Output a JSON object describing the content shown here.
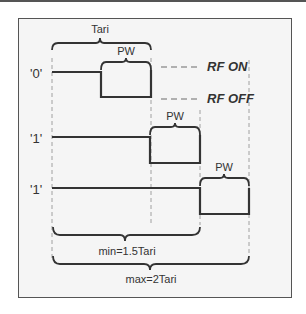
{
  "diagram": {
    "type": "timing-diagram",
    "labels": {
      "tari": "Tari",
      "pw_top": "PW",
      "pw_row2": "PW",
      "pw_row3": "PW",
      "rf_on": "RF ON",
      "rf_off": "RF OFF",
      "min": "min=1.5Tari",
      "max": "max=2Tari"
    },
    "rows": [
      {
        "symbol": "'0'",
        "description": "Data-0 symbol: high for Tari minus PW, then low for PW"
      },
      {
        "symbol": "'1'",
        "description": "Data-1 symbol (min 1.5 Tari)"
      },
      {
        "symbol": "'1'",
        "description": "Data-1 symbol (max 2 Tari)"
      }
    ],
    "colors": {
      "signal": "#333333",
      "dashed": "#999999",
      "background": "#f5f5f5",
      "frame": "#555555"
    }
  }
}
